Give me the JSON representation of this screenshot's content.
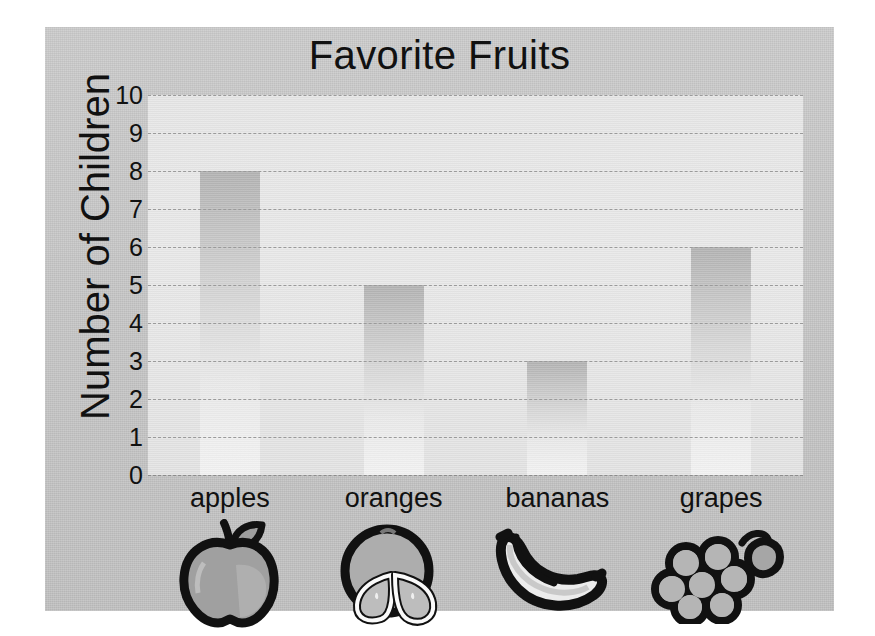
{
  "chart_data": {
    "type": "bar",
    "title": "Favorite Fruits",
    "xlabel": "",
    "ylabel": "Number of Children",
    "categories": [
      "apples",
      "oranges",
      "bananas",
      "grapes"
    ],
    "values": [
      8,
      5,
      3,
      6
    ],
    "ylim": [
      0,
      10
    ],
    "ytick_labels": [
      "10",
      "9",
      "8",
      "7",
      "6",
      "5",
      "4",
      "3",
      "2",
      "1",
      "0"
    ],
    "ytick_values": [
      10,
      9,
      8,
      7,
      6,
      5,
      4,
      3,
      2,
      1,
      0
    ],
    "grid": "horizontal-dashed",
    "legend": "none",
    "icons": [
      "apple-icon",
      "orange-icon",
      "banana-icon",
      "grapes-icon"
    ],
    "colors": {
      "card_background": "#c4c4c4",
      "plot_background": "#e5e5e5",
      "bar_top": "#b2b2b2",
      "bar_bottom": "#f2f2f2",
      "gridline": "#9a9a9a",
      "text": "#111111",
      "icon_outline": "#111111",
      "icon_fill": "#a8a8a8"
    }
  }
}
